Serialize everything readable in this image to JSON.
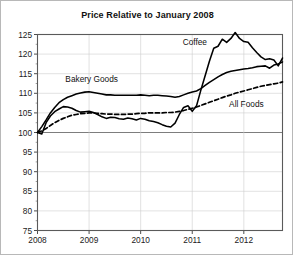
{
  "chart": {
    "title": "Price Relative to January 2008"
  },
  "chart_data": {
    "type": "line",
    "title": "Price Relative to January 2008",
    "xlabel": "",
    "ylabel": "",
    "xlim": [
      2008.0,
      2012.75
    ],
    "ylim": [
      75,
      125
    ],
    "grid": true,
    "legend": "inline-labels",
    "yticks": [
      75,
      80,
      85,
      90,
      95,
      100,
      105,
      110,
      115,
      120,
      125
    ],
    "ytick_labels": [
      "75",
      "80",
      "85",
      "90",
      "95",
      "100",
      "105",
      "110",
      "115",
      "120",
      "125"
    ],
    "xticks": [
      2008,
      2009,
      2010,
      2011,
      2012
    ],
    "xtick_labels": [
      "2008",
      "2009",
      "2010",
      "2011",
      "2012"
    ],
    "x": [
      2008.0,
      2008.083,
      2008.167,
      2008.25,
      2008.333,
      2008.417,
      2008.5,
      2008.583,
      2008.667,
      2008.75,
      2008.833,
      2008.917,
      2009.0,
      2009.083,
      2009.167,
      2009.25,
      2009.333,
      2009.417,
      2009.5,
      2009.583,
      2009.667,
      2009.75,
      2009.833,
      2009.917,
      2010.0,
      2010.083,
      2010.167,
      2010.25,
      2010.333,
      2010.417,
      2010.5,
      2010.583,
      2010.667,
      2010.75,
      2010.833,
      2010.917,
      2011.0,
      2011.083,
      2011.167,
      2011.25,
      2011.333,
      2011.417,
      2011.5,
      2011.583,
      2011.667,
      2011.75,
      2011.833,
      2011.917,
      2012.0,
      2012.083,
      2012.167,
      2012.25,
      2012.333,
      2012.417,
      2012.5,
      2012.583,
      2012.667,
      2012.75
    ],
    "series": [
      {
        "name": "Bakery Goods",
        "style": "solid",
        "color": "#000000",
        "values": [
          100.0,
          101.5,
          103.2,
          105.0,
          106.4,
          107.6,
          108.4,
          109.0,
          109.4,
          109.8,
          110.1,
          110.3,
          110.4,
          110.2,
          110.0,
          109.8,
          109.6,
          109.6,
          109.5,
          109.5,
          109.5,
          109.5,
          109.5,
          109.5,
          109.6,
          109.5,
          109.4,
          109.5,
          109.5,
          109.4,
          109.3,
          109.2,
          109.0,
          109.2,
          109.6,
          110.0,
          110.3,
          110.6,
          111.2,
          112.0,
          112.8,
          113.5,
          114.2,
          114.8,
          115.3,
          115.6,
          115.8,
          116.0,
          116.2,
          116.3,
          116.5,
          116.8,
          116.9,
          117.0,
          116.4,
          117.2,
          117.5,
          118.0
        ]
      },
      {
        "name": "Coffee",
        "style": "solid",
        "color": "#000000",
        "values": [
          100.0,
          99.6,
          102.5,
          104.2,
          105.3,
          106.0,
          106.6,
          106.5,
          106.2,
          105.6,
          105.2,
          105.3,
          105.4,
          105.1,
          104.6,
          104.0,
          103.6,
          103.9,
          103.8,
          103.5,
          103.4,
          103.7,
          103.5,
          103.2,
          103.6,
          103.4,
          103.0,
          102.8,
          102.5,
          102.0,
          101.6,
          101.4,
          102.4,
          104.6,
          106.4,
          106.8,
          105.4,
          106.8,
          110.8,
          114.5,
          118.2,
          121.5,
          122.0,
          123.8,
          123.0,
          124.0,
          125.5,
          124.0,
          123.2,
          123.0,
          121.6,
          120.4,
          119.3,
          118.6,
          118.8,
          118.5,
          117.0,
          119.0
        ]
      },
      {
        "name": "All Foods",
        "style": "dashed",
        "color": "#000000",
        "values": [
          100.0,
          100.4,
          101.0,
          101.8,
          102.5,
          103.1,
          103.6,
          104.0,
          104.4,
          104.6,
          104.8,
          104.9,
          105.0,
          105.0,
          104.9,
          104.8,
          104.7,
          104.7,
          104.6,
          104.6,
          104.6,
          104.7,
          104.7,
          104.8,
          104.9,
          104.9,
          105.0,
          105.0,
          105.0,
          105.0,
          105.1,
          105.1,
          105.2,
          105.4,
          105.6,
          105.9,
          106.2,
          106.5,
          106.9,
          107.3,
          107.7,
          108.1,
          108.5,
          108.9,
          109.3,
          109.6,
          110.0,
          110.3,
          110.6,
          110.9,
          111.2,
          111.5,
          111.8,
          112.0,
          112.2,
          112.4,
          112.6,
          112.9
        ]
      }
    ],
    "annotations": [
      {
        "text": "Coffee",
        "x": 2011.05,
        "y": 122.2
      },
      {
        "text": "Bakery Goods",
        "x": 2009.05,
        "y": 112.8
      },
      {
        "text": "All Foods",
        "x": 2012.05,
        "y": 106.6
      }
    ]
  }
}
